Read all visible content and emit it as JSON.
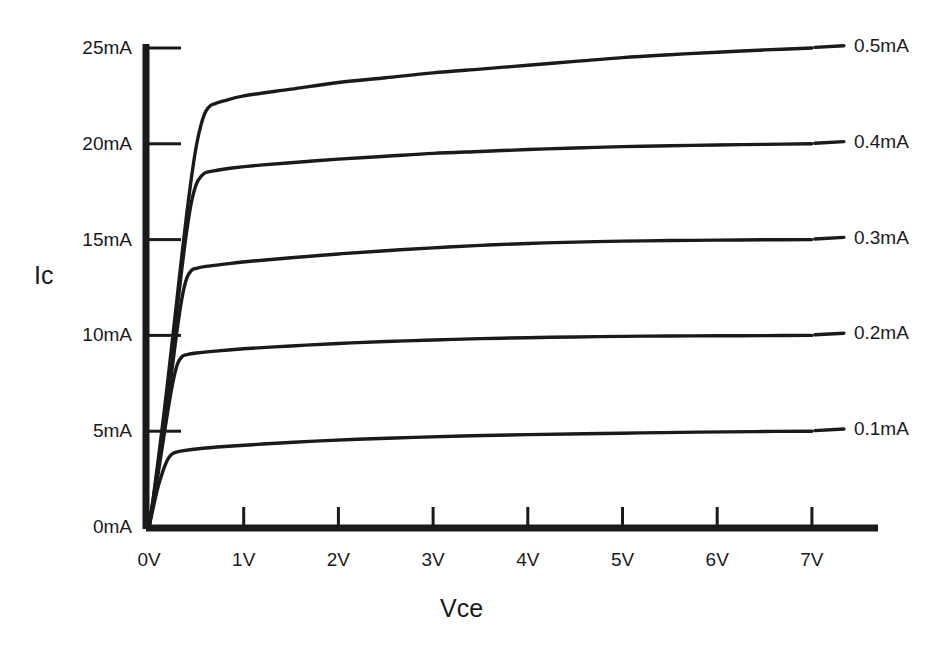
{
  "chart_data": {
    "type": "line",
    "title": "",
    "subtitle": "",
    "xlabel": "Vce",
    "ylabel": "Ic",
    "grid": false,
    "legend_position": "right-of-curve-ends",
    "xlim": [
      0,
      7.7
    ],
    "ylim": [
      0,
      25.5
    ],
    "xtick_labels": [
      "0V",
      "1V",
      "2V",
      "3V",
      "4V",
      "5V",
      "6V",
      "7V"
    ],
    "xtick_values": [
      0,
      1,
      2,
      3,
      4,
      5,
      6,
      7
    ],
    "ytick_labels": [
      "0mA",
      "5mA",
      "10mA",
      "15mA",
      "20mA",
      "25mA"
    ],
    "ytick_values": [
      0,
      5,
      10,
      15,
      20,
      25
    ],
    "series": [
      {
        "name": "0.5mA",
        "label": "0.5mA",
        "knee_voltage": 0.72,
        "plateau_value": 22.1,
        "end_value": 25.0,
        "x": [
          0,
          0.05,
          0.1,
          0.15,
          0.2,
          0.25,
          0.3,
          0.35,
          0.4,
          0.45,
          0.5,
          0.55,
          0.6,
          0.65,
          0.7,
          0.8,
          1.0,
          1.5,
          2.0,
          2.5,
          3.0,
          3.5,
          4.0,
          4.5,
          5.0,
          5.5,
          6.0,
          6.5,
          7.0
        ],
        "values": [
          0,
          1.7,
          3.6,
          5.6,
          7.7,
          9.9,
          12.1,
          14.3,
          16.4,
          18.3,
          19.9,
          21.0,
          21.7,
          22.0,
          22.1,
          22.25,
          22.5,
          22.85,
          23.2,
          23.45,
          23.7,
          23.9,
          24.1,
          24.3,
          24.5,
          24.65,
          24.78,
          24.9,
          25.0
        ]
      },
      {
        "name": "0.4mA",
        "label": "0.4mA",
        "knee_voltage": 0.62,
        "plateau_value": 18.5,
        "end_value": 20.0,
        "x": [
          0,
          0.05,
          0.1,
          0.15,
          0.2,
          0.25,
          0.3,
          0.35,
          0.4,
          0.45,
          0.5,
          0.55,
          0.6,
          0.7,
          0.9,
          1.2,
          1.6,
          2.0,
          2.5,
          3.0,
          3.5,
          4.0,
          4.5,
          5.0,
          5.5,
          6.0,
          6.5,
          7.0
        ],
        "values": [
          0,
          1.6,
          3.4,
          5.3,
          7.3,
          9.4,
          11.5,
          13.6,
          15.5,
          17.0,
          17.9,
          18.3,
          18.5,
          18.6,
          18.75,
          18.9,
          19.05,
          19.2,
          19.35,
          19.5,
          19.6,
          19.7,
          19.78,
          19.85,
          19.9,
          19.94,
          19.97,
          20.0
        ]
      },
      {
        "name": "0.3mA",
        "label": "0.3mA",
        "knee_voltage": 0.52,
        "plateau_value": 13.5,
        "end_value": 15.0,
        "x": [
          0,
          0.05,
          0.1,
          0.15,
          0.2,
          0.25,
          0.3,
          0.35,
          0.4,
          0.45,
          0.5,
          0.6,
          0.8,
          1.1,
          1.5,
          2.0,
          2.5,
          3.0,
          3.5,
          4.0,
          4.5,
          5.0,
          5.5,
          6.0,
          6.5,
          7.0
        ],
        "values": [
          0,
          1.5,
          3.1,
          4.8,
          6.6,
          8.5,
          10.4,
          12.0,
          13.0,
          13.4,
          13.5,
          13.6,
          13.72,
          13.88,
          14.05,
          14.25,
          14.42,
          14.57,
          14.7,
          14.8,
          14.87,
          14.92,
          14.95,
          14.97,
          14.99,
          15.0
        ]
      },
      {
        "name": "0.2mA",
        "label": "0.2mA",
        "knee_voltage": 0.4,
        "plateau_value": 9.0,
        "end_value": 10.0,
        "x": [
          0,
          0.05,
          0.1,
          0.15,
          0.2,
          0.25,
          0.3,
          0.35,
          0.4,
          0.5,
          0.7,
          1.0,
          1.5,
          2.0,
          2.5,
          3.0,
          3.5,
          4.0,
          4.5,
          5.0,
          5.5,
          6.0,
          6.5,
          7.0
        ],
        "values": [
          0,
          1.4,
          2.9,
          4.5,
          6.1,
          7.5,
          8.5,
          8.9,
          9.0,
          9.08,
          9.18,
          9.3,
          9.45,
          9.58,
          9.68,
          9.76,
          9.83,
          9.88,
          9.92,
          9.95,
          9.97,
          9.98,
          9.99,
          10.0
        ]
      },
      {
        "name": "0.1mA",
        "label": "0.1mA",
        "knee_voltage": 0.28,
        "plateau_value": 3.9,
        "end_value": 5.0,
        "x": [
          0,
          0.04,
          0.08,
          0.12,
          0.16,
          0.2,
          0.24,
          0.28,
          0.35,
          0.5,
          0.8,
          1.2,
          1.7,
          2.2,
          2.8,
          3.4,
          4.0,
          4.6,
          5.2,
          5.8,
          6.4,
          7.0
        ],
        "values": [
          0,
          0.9,
          1.8,
          2.5,
          3.1,
          3.55,
          3.8,
          3.9,
          3.97,
          4.07,
          4.2,
          4.33,
          4.47,
          4.58,
          4.68,
          4.76,
          4.82,
          4.87,
          4.91,
          4.95,
          4.98,
          5.0
        ]
      }
    ]
  },
  "axes": {
    "y_title": "Ic",
    "x_title": "Vce"
  },
  "style": {
    "background": "#ffffff",
    "ink": "#1a1a1a",
    "curve_color": "#1a1a1a"
  }
}
